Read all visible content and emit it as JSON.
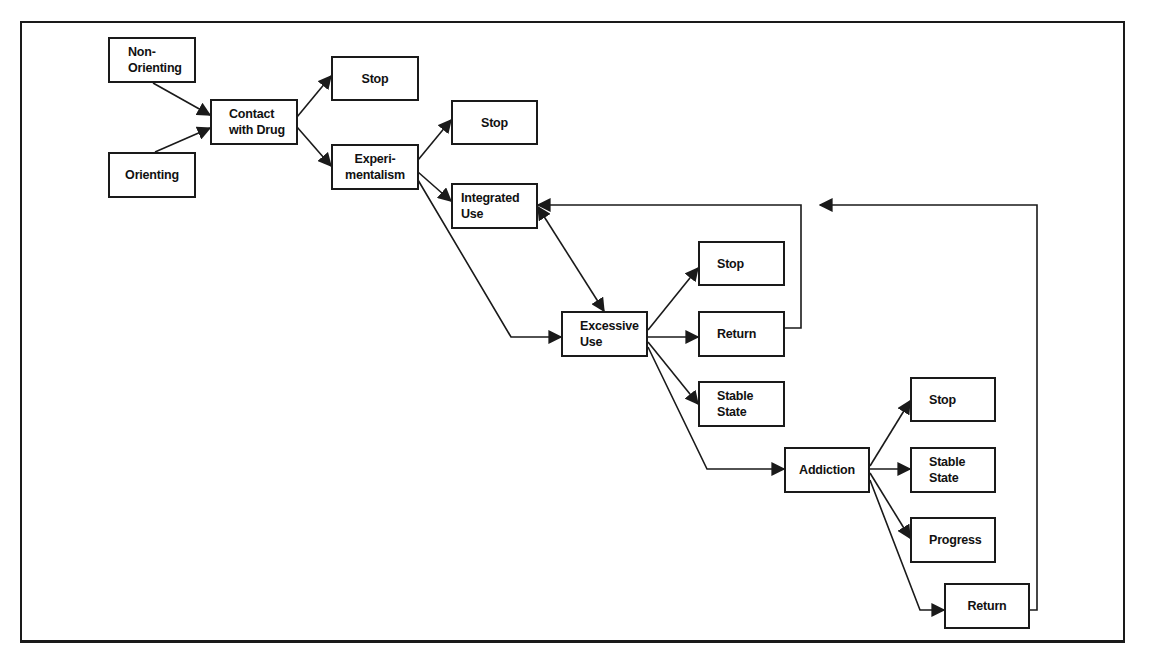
{
  "diagram": {
    "type": "flowchart",
    "colors": {
      "line": "#1a1a1a",
      "box_fill": "#ffffff",
      "text": "#111111"
    },
    "nodes": {
      "non_orienting": "Non-\nOrienting",
      "orienting": "Orienting",
      "contact_with_drug": "Contact\nwith Drug",
      "stop_1": "Stop",
      "experimentalism": "Experi-\nmentalism",
      "stop_2": "Stop",
      "integrated_use": "Integrated\nUse",
      "excessive_use": "Excessive\nUse",
      "stop_3": "Stop",
      "return_1": "Return",
      "stable_state_1": "Stable\nState",
      "addiction": "Addiction",
      "stop_4": "Stop",
      "stable_state_2": "Stable\nState",
      "progress": "Progress",
      "return_2": "Return"
    },
    "edges": [
      {
        "from": "Non-Orienting",
        "to": "Contact with Drug"
      },
      {
        "from": "Orienting",
        "to": "Contact with Drug"
      },
      {
        "from": "Contact with Drug",
        "to": "Stop"
      },
      {
        "from": "Contact with Drug",
        "to": "Experimentalism"
      },
      {
        "from": "Experimentalism",
        "to": "Stop"
      },
      {
        "from": "Experimentalism",
        "to": "Integrated Use"
      },
      {
        "from": "Experimentalism",
        "to": "Excessive Use"
      },
      {
        "from": "Integrated Use",
        "to": "Excessive Use",
        "bidirectional": true
      },
      {
        "from": "Excessive Use",
        "to": "Stop"
      },
      {
        "from": "Excessive Use",
        "to": "Return"
      },
      {
        "from": "Excessive Use",
        "to": "Stable State"
      },
      {
        "from": "Excessive Use",
        "to": "Addiction"
      },
      {
        "from": "Return",
        "to": "Integrated Use"
      },
      {
        "from": "Addiction",
        "to": "Stop"
      },
      {
        "from": "Addiction",
        "to": "Stable State"
      },
      {
        "from": "Addiction",
        "to": "Progress"
      },
      {
        "from": "Addiction",
        "to": "Return"
      },
      {
        "from": "Return",
        "to": "Excessive Use (loop)"
      }
    ]
  }
}
